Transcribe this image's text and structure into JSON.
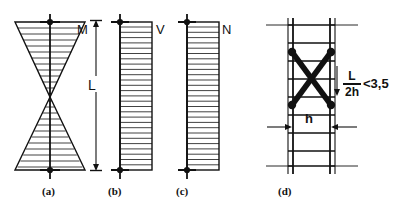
{
  "figure": {
    "background_color": "#ffffff",
    "ink_color": "#111111",
    "width": 405,
    "height": 213
  },
  "panels": [
    {
      "id": "a",
      "caption": "(a)",
      "caption_x": 42,
      "caption_y": 190,
      "quantity_symbol": "M",
      "symbol_x": 77,
      "symbol_y": 28,
      "shape": "bowtie-bending-moment-diagram",
      "axis_x": 50,
      "top_y": 20,
      "bottom_y": 172,
      "mid_y": 97,
      "half_width": 35,
      "hatch_count": 11
    },
    {
      "id": "b",
      "caption": "(b)",
      "caption_x": 108,
      "caption_y": 190,
      "quantity_symbol": "V",
      "symbol_x": 156,
      "symbol_y": 28,
      "shape": "rectangular-shear-diagram",
      "axis_x": 120,
      "block_right_x": 152,
      "top_y": 20,
      "bottom_y": 172,
      "hatch_count": 26
    },
    {
      "id": "c",
      "caption": "(c)",
      "caption_x": 176,
      "caption_y": 190,
      "quantity_symbol": "N",
      "symbol_x": 222,
      "symbol_y": 28,
      "shape": "rectangular-axial-diagram",
      "axis_x": 187,
      "block_right_x": 219,
      "top_y": 20,
      "bottom_y": 172,
      "hatch_count": 26
    },
    {
      "id": "d",
      "caption": "(d)",
      "caption_x": 278,
      "caption_y": 190,
      "shape": "masonry-pier-with-x-brace",
      "left_rail_x": 293,
      "right_rail_x": 330,
      "top_y": 22,
      "bottom_y": 170,
      "rung_count": 8,
      "brace_top_y": 52,
      "brace_bottom_y": 105
    }
  ],
  "dimensions": {
    "length": {
      "label": "L",
      "label_x": 91,
      "label_y": 82,
      "line_x": 96,
      "top_y": 20,
      "bottom_y": 172
    },
    "height": {
      "label": "h",
      "label_x": 308,
      "label_y": 118,
      "arrow_y": 127,
      "left_x": 293,
      "right_x": 330
    }
  },
  "annotation": {
    "numerator": "L",
    "denominator": "2h",
    "relation": "<3,5",
    "x": 340,
    "y": 72
  }
}
